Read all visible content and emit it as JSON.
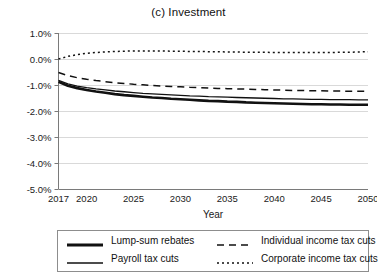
{
  "chart_data": {
    "type": "line",
    "title": "(c) Investment",
    "xlabel": "Year",
    "ylabel": "",
    "xlim": [
      2017,
      2050
    ],
    "ylim": [
      -5.0,
      1.0
    ],
    "grid": true,
    "y_unit": "%",
    "y_ticks": [
      "1.0%",
      "0.0%",
      "-1.0%",
      "-2.0%",
      "-3.0%",
      "-4.0%",
      "-5.0%"
    ],
    "y_tick_values": [
      1.0,
      0.0,
      -1.0,
      -2.0,
      -3.0,
      -4.0,
      -5.0
    ],
    "x_ticks": [
      "2017",
      "2020",
      "2025",
      "2030",
      "2035",
      "2040",
      "2045",
      "2050"
    ],
    "x_tick_values": [
      2017,
      2020,
      2025,
      2030,
      2035,
      2040,
      2045,
      2050
    ],
    "legend_position": "bottom",
    "x": [
      2017,
      2018,
      2019,
      2020,
      2021,
      2022,
      2023,
      2024,
      2025,
      2026,
      2027,
      2028,
      2029,
      2030,
      2031,
      2032,
      2033,
      2034,
      2035,
      2036,
      2037,
      2038,
      2039,
      2040,
      2041,
      2042,
      2043,
      2044,
      2045,
      2046,
      2047,
      2048,
      2049,
      2050
    ],
    "series": [
      {
        "name": "Lump-sum rebates",
        "style": "solid-thick",
        "values": [
          -0.88,
          -1.03,
          -1.12,
          -1.19,
          -1.25,
          -1.3,
          -1.35,
          -1.39,
          -1.42,
          -1.45,
          -1.48,
          -1.5,
          -1.53,
          -1.55,
          -1.57,
          -1.59,
          -1.61,
          -1.62,
          -1.64,
          -1.65,
          -1.67,
          -1.68,
          -1.69,
          -1.7,
          -1.71,
          -1.72,
          -1.73,
          -1.74,
          -1.74,
          -1.75,
          -1.75,
          -1.76,
          -1.76,
          -1.76
        ]
      },
      {
        "name": "Payroll tax cuts",
        "style": "solid-thin",
        "values": [
          -0.82,
          -0.96,
          -1.04,
          -1.1,
          -1.15,
          -1.19,
          -1.23,
          -1.26,
          -1.29,
          -1.32,
          -1.34,
          -1.36,
          -1.38,
          -1.4,
          -1.42,
          -1.43,
          -1.45,
          -1.46,
          -1.47,
          -1.48,
          -1.49,
          -1.5,
          -1.51,
          -1.52,
          -1.53,
          -1.53,
          -1.54,
          -1.55,
          -1.55,
          -1.56,
          -1.56,
          -1.56,
          -1.57,
          -1.57
        ]
      },
      {
        "name": "Individual income tax cuts",
        "style": "dashed",
        "values": [
          -0.52,
          -0.64,
          -0.72,
          -0.78,
          -0.83,
          -0.87,
          -0.91,
          -0.94,
          -0.97,
          -0.99,
          -1.02,
          -1.04,
          -1.06,
          -1.07,
          -1.09,
          -1.1,
          -1.12,
          -1.13,
          -1.14,
          -1.15,
          -1.16,
          -1.17,
          -1.18,
          -1.19,
          -1.2,
          -1.21,
          -1.21,
          -1.22,
          -1.22,
          -1.23,
          -1.23,
          -1.24,
          -1.24,
          -1.24
        ]
      },
      {
        "name": "Corporate income tax cuts",
        "style": "dotted",
        "values": [
          0.0,
          0.1,
          0.17,
          0.22,
          0.25,
          0.27,
          0.29,
          0.3,
          0.31,
          0.31,
          0.31,
          0.31,
          0.3,
          0.3,
          0.29,
          0.29,
          0.28,
          0.28,
          0.27,
          0.27,
          0.26,
          0.26,
          0.26,
          0.25,
          0.25,
          0.25,
          0.25,
          0.25,
          0.25,
          0.25,
          0.26,
          0.26,
          0.27,
          0.28
        ]
      }
    ]
  },
  "legend": {
    "entries": [
      {
        "label": "Lump-sum rebates",
        "style": "solid-thick"
      },
      {
        "label": "Payroll tax cuts",
        "style": "solid-thin"
      },
      {
        "label": "Individual income tax cuts",
        "style": "dashed"
      },
      {
        "label": "Corporate income tax cuts",
        "style": "dotted"
      }
    ]
  },
  "colors": {
    "line": "#111111",
    "grid": "#d9d9d9",
    "axis": "#7a7a7a",
    "legend_border": "#8d8d8d",
    "text": "#1a1a1a",
    "background": "#ffffff"
  }
}
